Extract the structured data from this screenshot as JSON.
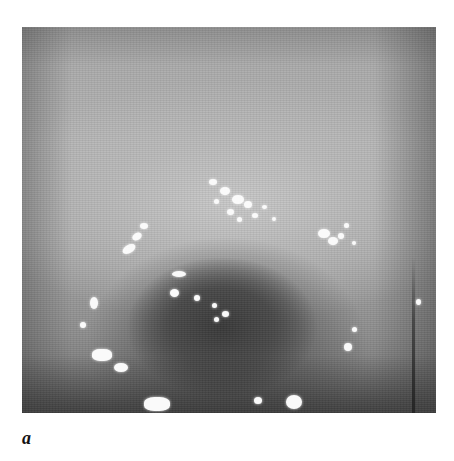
{
  "figure": {
    "panel_label": "a"
  }
}
